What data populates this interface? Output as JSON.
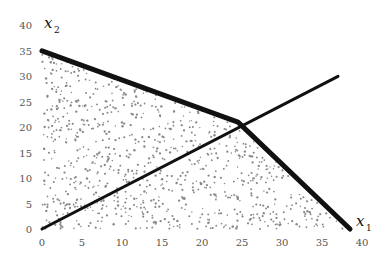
{
  "chart_data": {
    "type": "scatter",
    "title": "",
    "xlabel": "x",
    "xlabel_subscript": "1",
    "ylabel": "x",
    "ylabel_subscript": "2",
    "xlim": [
      0,
      40
    ],
    "ylim": [
      0,
      40
    ],
    "x_ticks": [
      0,
      5,
      10,
      15,
      20,
      25,
      30,
      35,
      40
    ],
    "y_ticks": [
      0,
      5,
      10,
      15,
      20,
      25,
      30,
      35,
      40
    ],
    "grid": false,
    "legend": null,
    "feasible_region": {
      "description": "Stippled random points filling polygon bounded by axes and constraint lines",
      "vertices": [
        [
          0,
          0
        ],
        [
          0,
          35
        ],
        [
          24.5,
          21
        ],
        [
          38.5,
          0
        ]
      ],
      "point_color": "#888888",
      "point_count_approx": 900
    },
    "series": [
      {
        "name": "constraint-boundary",
        "style": "thick",
        "color": "#111111",
        "points": [
          [
            0,
            35
          ],
          [
            24.5,
            21
          ],
          [
            38.5,
            0
          ]
        ]
      },
      {
        "name": "ray-through-origin",
        "style": "medium",
        "color": "#111111",
        "points": [
          [
            0,
            0
          ],
          [
            37,
            30
          ]
        ]
      }
    ]
  }
}
